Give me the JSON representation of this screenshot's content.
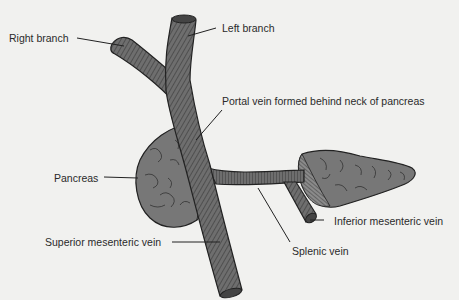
{
  "diagram": {
    "colors": {
      "background": "#f1f1ef",
      "vein_fill": "#6e6e6e",
      "vein_stripe": "#3a3a3a",
      "outline": "#222222",
      "pancreas_fill": "#777777",
      "text": "#2a2a2a"
    },
    "labels": {
      "right_branch": "Right branch",
      "left_branch": "Left branch",
      "portal_vein": "Portal vein formed behind neck of pancreas",
      "pancreas": "Pancreas",
      "inferior_mesenteric_vein": "Inferior mesenteric vein",
      "superior_mesenteric_vein": "Superior mesenteric vein",
      "splenic_vein": "Splenic vein"
    }
  }
}
